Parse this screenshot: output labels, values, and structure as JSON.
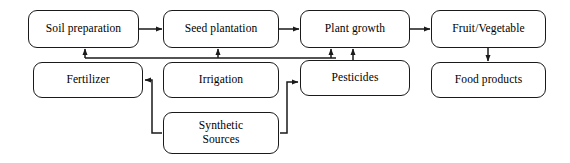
{
  "diagram": {
    "background_color": "#ffffff",
    "stroke_color": "#1a1a1a",
    "text_color": "#000000",
    "nodes": [
      {
        "id": "soil_preparation",
        "label": "Soil preparation",
        "x": 28,
        "y": 10,
        "w": 111,
        "h": 38
      },
      {
        "id": "seed_plantation",
        "label": "Seed plantation",
        "x": 163,
        "y": 10,
        "w": 116,
        "h": 38
      },
      {
        "id": "plant_growth",
        "label": "Plant growth",
        "x": 300,
        "y": 10,
        "w": 110,
        "h": 38
      },
      {
        "id": "fruit_vegetable",
        "label": "Fruit/Vegetable",
        "x": 431,
        "y": 10,
        "w": 115,
        "h": 38
      },
      {
        "id": "fertilizer",
        "label": "Fertilizer",
        "x": 33,
        "y": 62,
        "w": 110,
        "h": 36
      },
      {
        "id": "irrigation",
        "label": "Irrigation",
        "x": 163,
        "y": 62,
        "w": 116,
        "h": 36
      },
      {
        "id": "pesticides",
        "label": "Pesticides",
        "x": 300,
        "y": 60,
        "w": 110,
        "h": 36
      },
      {
        "id": "food_products",
        "label": "Food products",
        "x": 431,
        "y": 62,
        "w": 115,
        "h": 36
      },
      {
        "id": "synthetic_sources",
        "label": "Synthetic\nSources",
        "x": 163,
        "y": 112,
        "w": 116,
        "h": 42
      }
    ],
    "edges": [
      {
        "id": "soil-to-seed",
        "from": "soil_preparation",
        "to": "seed_plantation"
      },
      {
        "id": "seed-to-plant",
        "from": "seed_plantation",
        "to": "plant_growth"
      },
      {
        "id": "plant-to-fruit",
        "from": "plant_growth",
        "to": "fruit_vegetable"
      },
      {
        "id": "fruit-to-food",
        "from": "fruit_vegetable",
        "to": "food_products"
      },
      {
        "id": "inputs-to-soil",
        "from": "fertilizer",
        "to": "soil_preparation"
      },
      {
        "id": "inputs-to-seed",
        "from": "fertilizer",
        "to": "seed_plantation"
      },
      {
        "id": "inputs-to-plant",
        "from": "fertilizer",
        "to": "plant_growth"
      },
      {
        "id": "pesticides-to-plant",
        "from": "pesticides",
        "to": "plant_growth"
      },
      {
        "id": "synthetic-to-fertilizer",
        "from": "synthetic_sources",
        "to": "fertilizer"
      },
      {
        "id": "synthetic-to-pesticides",
        "from": "synthetic_sources",
        "to": "pesticides"
      }
    ]
  }
}
